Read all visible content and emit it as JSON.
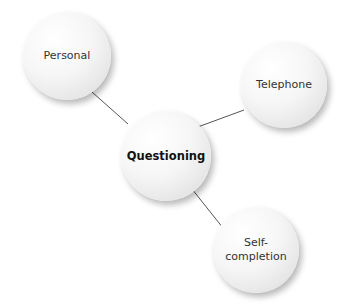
{
  "diagram": {
    "type": "hub-and-spoke",
    "center": {
      "label": "Questioning",
      "x": 166,
      "y": 156,
      "r": 45
    },
    "nodes": [
      {
        "id": "personal",
        "label": "Personal",
        "x": 67,
        "y": 56,
        "r": 44
      },
      {
        "id": "telephone",
        "label": "Telephone",
        "x": 284,
        "y": 85,
        "r": 43
      },
      {
        "id": "self-completion",
        "label": "Self-\ncompletion",
        "label_line1": "Self-",
        "label_line2": "completion",
        "x": 256,
        "y": 250,
        "r": 43
      }
    ],
    "edges": [
      {
        "from": "personal",
        "to": "Questioning",
        "x1": 92,
        "y1": 92,
        "x2": 128,
        "y2": 124
      },
      {
        "from": "telephone",
        "to": "Questioning",
        "x1": 244,
        "y1": 110,
        "x2": 195,
        "y2": 128
      },
      {
        "from": "Questioning",
        "to": "self-completion",
        "x1": 188,
        "y1": 184,
        "x2": 227,
        "y2": 233
      }
    ],
    "colors": {
      "line": "#555555",
      "text": "#333333",
      "center_text": "#111111"
    }
  }
}
